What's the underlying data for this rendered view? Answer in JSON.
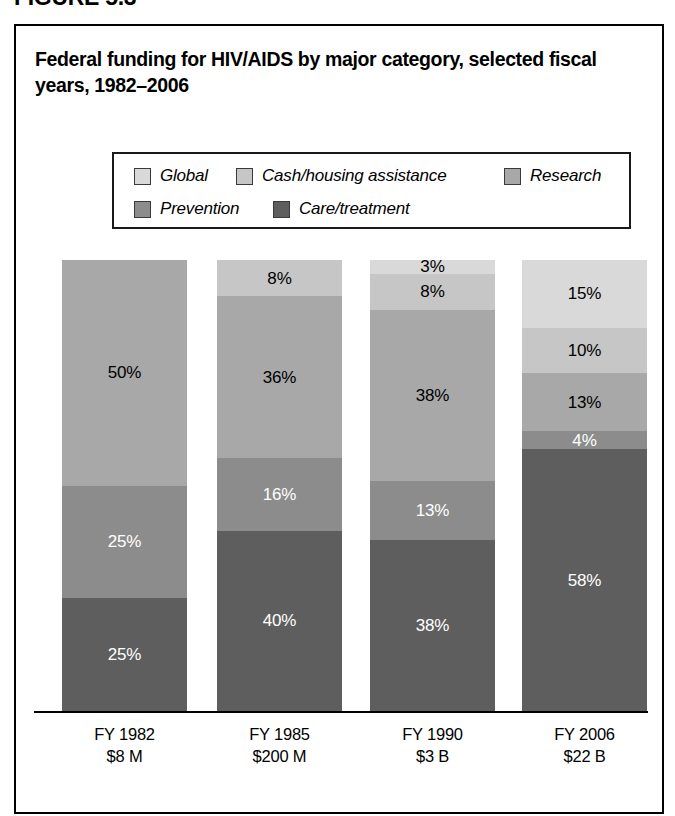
{
  "figure": {
    "caption": "FIGURE 5.3",
    "title": "Federal funding for HIV/AIDS by major category, selected fiscal years, 1982–2006"
  },
  "legend": {
    "items": [
      {
        "label": "Global",
        "color": "#d9d9d9"
      },
      {
        "label": "Cash/housing assistance",
        "color": "#c6c6c6"
      },
      {
        "label": "Research",
        "color": "#a8a8a8"
      },
      {
        "label": "Prevention",
        "color": "#8c8c8c"
      },
      {
        "label": "Care/treatment",
        "color": "#5e5e5e"
      }
    ]
  },
  "chart_data": {
    "type": "bar",
    "subtype": "stacked-100-percent",
    "title": "Federal funding for HIV/AIDS by major category, selected fiscal years, 1982–2006",
    "xlabel": "",
    "ylabel": "",
    "ylim": [
      0,
      100
    ],
    "grid": false,
    "legend_position": "top",
    "categories": [
      "FY 1982",
      "FY 1985",
      "FY 1990",
      "FY 2006"
    ],
    "category_sublabels": [
      "$8 M",
      "$200 M",
      "$3 B",
      "$22 B"
    ],
    "series": [
      {
        "name": "Global",
        "color": "#d9d9d9",
        "values": [
          0,
          0,
          3,
          15
        ],
        "labels": [
          "",
          "",
          "3%",
          "15%"
        ],
        "label_color": [
          "dark",
          "dark",
          "dark",
          "dark"
        ]
      },
      {
        "name": "Cash/housing assistance",
        "color": "#c6c6c6",
        "values": [
          0,
          8,
          8,
          10
        ],
        "labels": [
          "",
          "8%",
          "8%",
          "10%"
        ],
        "label_color": [
          "dark",
          "dark",
          "dark",
          "dark"
        ]
      },
      {
        "name": "Research",
        "color": "#a8a8a8",
        "values": [
          50,
          36,
          38,
          13
        ],
        "labels": [
          "50%",
          "36%",
          "38%",
          "13%"
        ],
        "label_color": [
          "dark",
          "dark",
          "dark",
          "dark"
        ]
      },
      {
        "name": "Prevention",
        "color": "#8c8c8c",
        "values": [
          25,
          16,
          13,
          4
        ],
        "labels": [
          "25%",
          "16%",
          "13%",
          "4%"
        ],
        "label_color": [
          "light",
          "light",
          "light",
          "light"
        ]
      },
      {
        "name": "Care/treatment",
        "color": "#5e5e5e",
        "values": [
          25,
          40,
          38,
          58
        ],
        "labels": [
          "25%",
          "40%",
          "38%",
          "58%"
        ],
        "label_color": [
          "light",
          "light",
          "light",
          "light"
        ]
      }
    ]
  },
  "axis": {
    "ticks": [
      {
        "year": "FY 1982",
        "amount": "$8 M"
      },
      {
        "year": "FY 1985",
        "amount": "$200 M"
      },
      {
        "year": "FY 1990",
        "amount": "$3 B"
      },
      {
        "year": "FY 2006",
        "amount": "$22 B"
      }
    ]
  }
}
